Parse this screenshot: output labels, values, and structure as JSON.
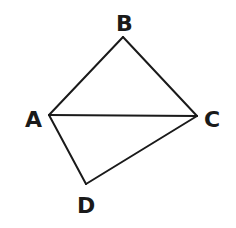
{
  "diagram": {
    "type": "geometry",
    "stroke_color": "#1a1a1a",
    "background": "#ffffff",
    "points": {
      "A": {
        "label": "A",
        "x": 49,
        "y": 115
      },
      "B": {
        "label": "B",
        "x": 123,
        "y": 37
      },
      "C": {
        "label": "C",
        "x": 197,
        "y": 116
      },
      "D": {
        "label": "D",
        "x": 86,
        "y": 184
      }
    },
    "segments": [
      "AB",
      "BC",
      "AC",
      "AD",
      "DC"
    ]
  }
}
